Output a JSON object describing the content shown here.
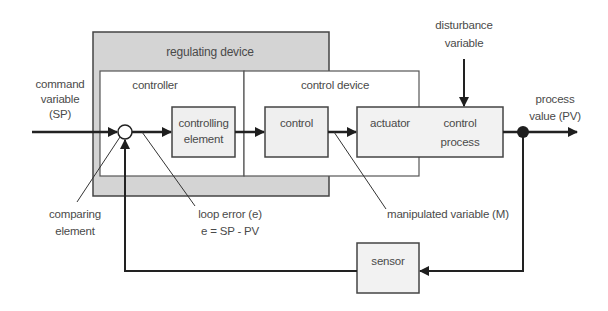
{
  "diagram": {
    "type": "control-loop-block-diagram",
    "containers": {
      "regulating_device": "regulating device",
      "controller": "controller",
      "control_device": "control device"
    },
    "blocks": {
      "controlling_element": [
        "controlling",
        "element"
      ],
      "control": "control",
      "actuator": "actuator",
      "control_process": [
        "control",
        "process"
      ],
      "sensor": "sensor"
    },
    "signals": {
      "command_variable": [
        "command",
        "variable",
        "(SP)"
      ],
      "disturbance_variable": [
        "disturbance",
        "variable"
      ],
      "process_value": [
        "process",
        "value (PV)"
      ]
    },
    "annotations": {
      "comparing_element": [
        "comparing",
        "element"
      ],
      "loop_error": [
        "loop error (e)",
        "e = SP - PV"
      ],
      "manipulated_variable": "manipulated variable (M)"
    },
    "colors": {
      "line": "#2a2a2a",
      "gray_fill": "#d4d4d4",
      "block_fill": "#f2f2f2",
      "text": "#4a4a4a"
    }
  }
}
